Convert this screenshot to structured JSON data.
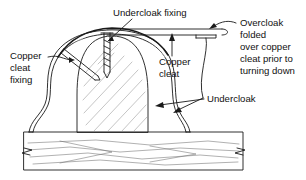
{
  "figure": {
    "line_color": "#1a1a1a",
    "hatch_color": "#6b6b6b",
    "background": "#ffffff"
  },
  "labels": {
    "undercloak_fixing": {
      "text": "Undercloak fixing"
    },
    "copper_cleat_fixing": {
      "line1": "Copper",
      "line2": "cleat",
      "line3": "fixing"
    },
    "copper_cleat": {
      "line1": "Copper",
      "line2": "cleat"
    },
    "overcloak": {
      "line1": "Overcloak",
      "line2": "folded",
      "line3": "over copper",
      "line4": "cleat prior to",
      "line5": "turning down"
    },
    "undercloak": {
      "text": "Undercloak"
    }
  },
  "parts": {
    "roll": "timber-roll",
    "deck": "timber-deck",
    "overcloak_strip": "overcloak-copper-strip",
    "undercloak_sheet": "undercloak-copper-sheet",
    "cleat": "copper-cleat",
    "screw": "undercloak-fixing-screw",
    "nail": "copper-cleat-fixing-nail",
    "break_symbol_left": "deck-break-symbol-left",
    "break_symbol_right": "deck-break-symbol-right"
  }
}
